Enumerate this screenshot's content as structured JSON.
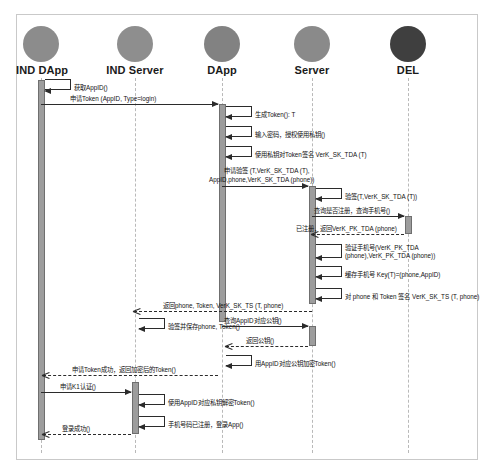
{
  "diagram": {
    "type": "uml-sequence",
    "colors": {
      "frame": "#c9c9c9",
      "lifeline": "#b9b9b9",
      "activation_fill": "#9d9d9d",
      "activation_stroke": "#6f6f6f",
      "message": "#2b2b2b"
    }
  },
  "participants": [
    {
      "id": "ind_dapp",
      "label": "IND DApp",
      "x": 41,
      "ball_color": "#8c8c8c"
    },
    {
      "id": "ind_server",
      "label": "IND Server",
      "x": 135,
      "ball_color": "#8e8e8e"
    },
    {
      "id": "dapp",
      "label": "DApp",
      "x": 222,
      "ball_color": "#828282"
    },
    {
      "id": "server",
      "label": "Server",
      "x": 312,
      "ball_color": "#8a8a8a"
    },
    {
      "id": "del",
      "label": "DEL",
      "x": 408,
      "ball_color": "#3f3f3f"
    }
  ],
  "messages": [
    {
      "id": "m01",
      "kind": "self",
      "from": "ind_dapp",
      "to": "ind_dapp",
      "label": "获取AppID()"
    },
    {
      "id": "m02",
      "kind": "sync",
      "from": "ind_dapp",
      "to": "dapp",
      "label": "申请Token (AppID, Type=login)"
    },
    {
      "id": "m03",
      "kind": "self",
      "from": "dapp",
      "to": "dapp",
      "label": "生成Token(): T"
    },
    {
      "id": "m04",
      "kind": "self",
      "from": "dapp",
      "to": "dapp",
      "label": "输入密码，授权使用私钥()"
    },
    {
      "id": "m05",
      "kind": "self",
      "from": "dapp",
      "to": "dapp",
      "label": "使用私钥对Token签名 VerK_SK_TDA (T)"
    },
    {
      "id": "m06",
      "kind": "sync",
      "from": "dapp",
      "to": "server",
      "label": "申请验签 (T,VerK_SK_TDA (T),",
      "label2": "AppID,phone,VerK_SK_TDA (phone))"
    },
    {
      "id": "m07",
      "kind": "self",
      "from": "server",
      "to": "server",
      "label": "验签(T,VerK_SK_TDA  (T))"
    },
    {
      "id": "m08",
      "kind": "sync",
      "from": "server",
      "to": "del",
      "label": "查询是否注册，查询手机号()"
    },
    {
      "id": "m09",
      "kind": "return",
      "from": "del",
      "to": "server",
      "label": "已注册，返回VerK_PK_TDA (phone)"
    },
    {
      "id": "m10",
      "kind": "self",
      "from": "server",
      "to": "server",
      "label": "验证手机号(VerK_PK_TDA",
      "label2": "(phone),VerK_PK_TDA  (phone))"
    },
    {
      "id": "m11",
      "kind": "self",
      "from": "server",
      "to": "server",
      "label": "缓存手机号 Key(T)=(phone,AppID)"
    },
    {
      "id": "m12",
      "kind": "self",
      "from": "server",
      "to": "server",
      "label": "对 phone 和 Token 签名 VerK_SK_TS (T, phone)"
    },
    {
      "id": "m13",
      "kind": "return",
      "from": "server",
      "to": "dapp",
      "label": "返回phone, Token, VerK_SK_TS (T, phone)"
    },
    {
      "id": "m14",
      "kind": "self",
      "from": "dapp",
      "to": "dapp",
      "label": "验签并保存phone, Token()"
    },
    {
      "id": "m15",
      "kind": "sync",
      "from": "dapp",
      "to": "server",
      "label": "查询AppID对应公钥()"
    },
    {
      "id": "m16",
      "kind": "return",
      "from": "server",
      "to": "dapp",
      "label": "返回公钥()"
    },
    {
      "id": "m17",
      "kind": "self",
      "from": "dapp",
      "to": "dapp",
      "label": "用AppID对应公钥加密Token()"
    },
    {
      "id": "m18",
      "kind": "return",
      "from": "dapp",
      "to": "ind_dapp",
      "label": "申请Token成功，返回加密后的Token()"
    },
    {
      "id": "m19",
      "kind": "sync",
      "from": "ind_dapp",
      "to": "ind_server",
      "label": "申请K1认证()"
    },
    {
      "id": "m20",
      "kind": "self",
      "from": "ind_server",
      "to": "ind_server",
      "label": "使用AppID对应私钥解密Token()"
    },
    {
      "id": "m21",
      "kind": "self",
      "from": "ind_server",
      "to": "ind_server",
      "label": "手机号码已注册，登录App()"
    },
    {
      "id": "m22",
      "kind": "return",
      "from": "ind_server",
      "to": "ind_dapp",
      "label": "登录成功()"
    }
  ]
}
